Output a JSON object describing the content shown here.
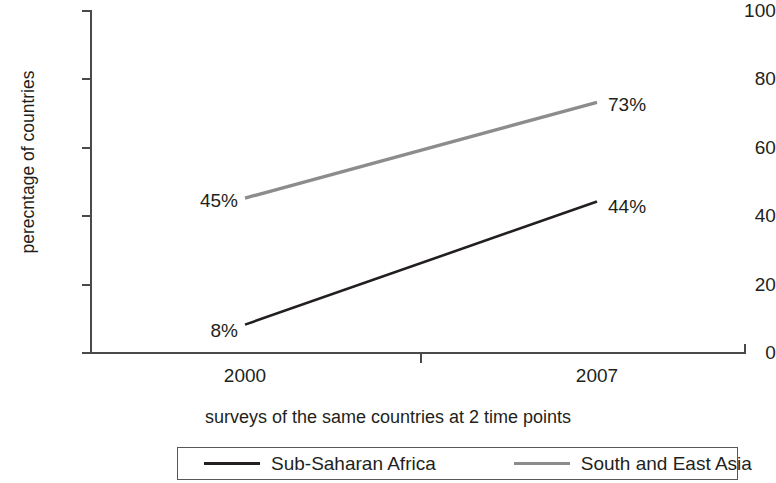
{
  "chart_data": {
    "type": "line",
    "title": "",
    "subtitle": "",
    "xlabel": "surveys of the same countries at 2 time points",
    "ylabel": "perecntage of countries",
    "categories": [
      "2000",
      "2007"
    ],
    "x": [
      2000,
      2007
    ],
    "xtick_labels": [
      "2000",
      "2007"
    ],
    "ytick_labels": [
      "0",
      "20",
      "40",
      "60",
      "80",
      "100"
    ],
    "yticks": [
      0,
      20,
      40,
      60,
      80,
      100
    ],
    "ylim": [
      0,
      100
    ],
    "xlim": [
      2000,
      2007
    ],
    "grid": false,
    "legend_position": "bottom-center",
    "legend_boxed": true,
    "series": [
      {
        "name": "Sub-Saharan Africa",
        "values": [
          8,
          44
        ],
        "color": "#231f20",
        "point_labels": [
          "8%",
          "44%"
        ]
      },
      {
        "name": "South and East Asia",
        "values": [
          45,
          73
        ],
        "color": "#8c8c8e",
        "point_labels": [
          "45%",
          "73%"
        ]
      }
    ],
    "annotations": [
      "8%",
      "45%",
      "44%",
      "73%"
    ]
  },
  "axis": {
    "y_title": "perecntage of countries",
    "x_title": "surveys of the same countries at 2 time points",
    "y_ticks": [
      {
        "label": "100",
        "value": 100
      },
      {
        "label": "80",
        "value": 80
      },
      {
        "label": "60",
        "value": 60
      },
      {
        "label": "40",
        "value": 40
      },
      {
        "label": "20",
        "value": 20
      },
      {
        "label": "0",
        "value": 0
      }
    ],
    "x_ticks": [
      {
        "label": "2000",
        "value": 2000
      },
      {
        "label": "2007",
        "value": 2007
      }
    ]
  },
  "labels": {
    "africa_start": "8%",
    "africa_end": "44%",
    "asia_start": "45%",
    "asia_end": "73%"
  },
  "legend": {
    "items": [
      {
        "label": "Sub-Saharan Africa",
        "color": "#231f20"
      },
      {
        "label": "South and East Asia",
        "color": "#8c8c8e"
      }
    ]
  }
}
